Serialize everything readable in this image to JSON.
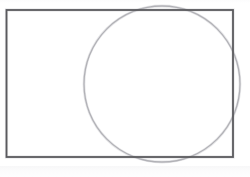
{
  "figure": {
    "background_color": "#ffffff",
    "width": 250,
    "height": 177,
    "caption": "",
    "shapes": [
      {
        "name": "rectangle",
        "kind": "rectangle",
        "label": "Rectangle",
        "x": 6.5,
        "y": 10.0,
        "width": 226.5,
        "height": 147.0,
        "left": 6.5,
        "top": 10.0,
        "right": 233.0,
        "bottom": 157.0,
        "stroke_color": "#5a5a5e",
        "stroke_width": 1.8,
        "fill": "none"
      },
      {
        "name": "circle",
        "kind": "circle",
        "label": "Circle",
        "cx": 162.0,
        "cy": 84.0,
        "r": 78.0,
        "left": 84.0,
        "top": 6.0,
        "right": 240.0,
        "bottom": 162.0,
        "stroke_color": "#b2b2b7",
        "stroke_width": 1.3,
        "fill": "none"
      }
    ],
    "notes": {
      "relationship": "circle overlaps the right portion of the rectangle and extends past its top, right and bottom edges",
      "artifact": "faint horizontal scan noise band along the bottom margin"
    }
  }
}
